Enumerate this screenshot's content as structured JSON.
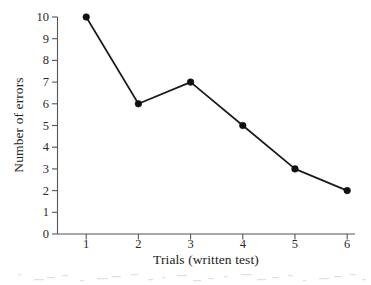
{
  "chart_data": {
    "type": "line",
    "title": "",
    "xlabel": "Trials (written test)",
    "ylabel": "Number of errors",
    "x": [
      1,
      2,
      3,
      4,
      5,
      6
    ],
    "values": [
      10,
      6,
      7,
      5,
      3,
      2
    ],
    "categories": [
      "1",
      "2",
      "3",
      "4",
      "5",
      "6"
    ],
    "xlim": [
      0.45,
      6.15
    ],
    "ylim": [
      0,
      10
    ],
    "xticks": [
      1,
      2,
      3,
      4,
      5,
      6
    ],
    "xticklabels": [
      "1",
      "2",
      "3",
      "4",
      "5",
      "6"
    ],
    "yticks": [
      0,
      1,
      2,
      3,
      4,
      5,
      6,
      7,
      8,
      9,
      10
    ],
    "yticklabels": [
      "0",
      "1",
      "2",
      "3",
      "4",
      "5",
      "6",
      "7",
      "8",
      "9",
      "10"
    ],
    "grid": false,
    "legend": null,
    "marker": "filled-circle",
    "line_color": "#1a1a1a",
    "marker_color": "#111111",
    "axis_color": "#555555",
    "background": "#ffffff"
  }
}
